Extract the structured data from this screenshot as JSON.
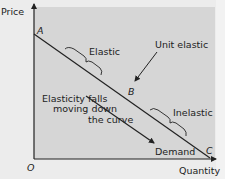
{
  "diagram": {
    "axes": {
      "y_label": "Price",
      "x_label": "Quantity",
      "origin_label": "O"
    },
    "points": {
      "a": "A",
      "b": "B",
      "c": "C"
    },
    "curve_label": "Demand",
    "annotations": {
      "elastic": "Elastic",
      "unit_elastic": "Unit elastic",
      "inelastic": "Inelastic",
      "elasticity_note_line1": "Elasticity falls",
      "elasticity_note_line2": "moving down",
      "elasticity_note_line3": "the curve"
    },
    "colors": {
      "plot_background": "#d6d6d6",
      "page_background": "#ececec",
      "line": "#222222",
      "text": "#222222"
    }
  }
}
